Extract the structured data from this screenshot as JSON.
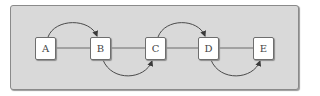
{
  "diagram": {
    "type": "linked-list-with-skip-arcs",
    "colors": {
      "background": "#d9d9d9",
      "frame_border": "#8a8a8a",
      "node_fill": "#ffffff",
      "node_border": "#6e6e6e",
      "edge": "#4a4a4a",
      "label": "#444444"
    },
    "nodes": [
      {
        "id": "A",
        "label": "A",
        "x": 35,
        "y": 37
      },
      {
        "id": "B",
        "label": "B",
        "x": 90,
        "y": 37
      },
      {
        "id": "C",
        "label": "C",
        "x": 145,
        "y": 37
      },
      {
        "id": "D",
        "label": "D",
        "x": 198,
        "y": 37
      },
      {
        "id": "E",
        "label": "E",
        "x": 253,
        "y": 37
      }
    ],
    "line_edges": [
      {
        "from": "A",
        "to": "B"
      },
      {
        "from": "B",
        "to": "C"
      },
      {
        "from": "C",
        "to": "D"
      },
      {
        "from": "D",
        "to": "E"
      }
    ],
    "arc_edges": [
      {
        "from": "A",
        "to": "B",
        "side": "top",
        "arrow": true
      },
      {
        "from": "B",
        "to": "C",
        "side": "bottom",
        "arrow": true
      },
      {
        "from": "C",
        "to": "D",
        "side": "top",
        "arrow": true
      },
      {
        "from": "D",
        "to": "E",
        "side": "bottom",
        "arrow": true
      }
    ]
  }
}
